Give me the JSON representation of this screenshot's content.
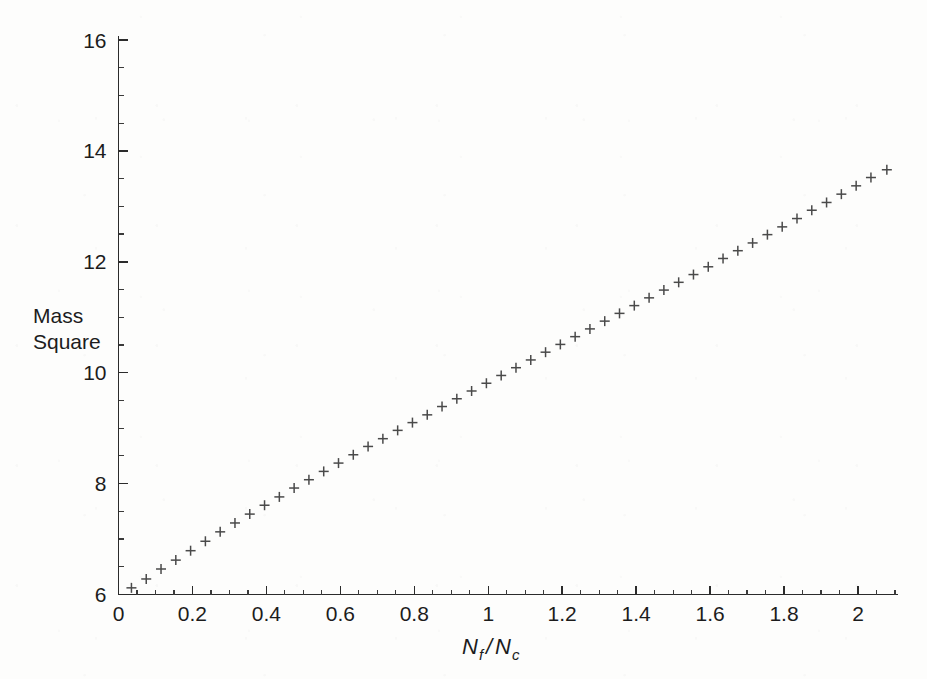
{
  "chart_data": {
    "type": "scatter",
    "title": "",
    "xlabel": "Nf/Nc",
    "xlabel_parts": {
      "n1": "N",
      "sub1": "f",
      "slash": "/",
      "n2": "N",
      "sub2": "c"
    },
    "ylabel": "Mass Square",
    "ylabel_line1": "Mass",
    "ylabel_line2": "Square",
    "marker": "plus",
    "marker_color": "#4a4a4a",
    "grid": false,
    "legend": null,
    "xlim": [
      0,
      2.12
    ],
    "ylim": [
      6,
      16
    ],
    "x_ticks": [
      0,
      0.2,
      0.4,
      0.6,
      0.8,
      1,
      1.2,
      1.4,
      1.6,
      1.8,
      2
    ],
    "x_tick_labels": [
      "0",
      "0.2",
      "0.4",
      "0.6",
      "0.8",
      "1",
      "1.2",
      "1.4",
      "1.6",
      "1.8",
      "2"
    ],
    "x_minor_step": 0.05,
    "y_ticks": [
      6,
      8,
      10,
      12,
      14,
      16
    ],
    "y_tick_labels": [
      "6",
      "8",
      "10",
      "12",
      "14",
      "16"
    ],
    "y_minor_step": 0.5,
    "x": [
      0.035,
      0.075,
      0.115,
      0.155,
      0.195,
      0.235,
      0.275,
      0.315,
      0.355,
      0.395,
      0.435,
      0.475,
      0.515,
      0.555,
      0.595,
      0.635,
      0.675,
      0.715,
      0.755,
      0.795,
      0.835,
      0.875,
      0.915,
      0.955,
      0.995,
      1.035,
      1.075,
      1.115,
      1.155,
      1.195,
      1.235,
      1.275,
      1.315,
      1.355,
      1.395,
      1.435,
      1.475,
      1.515,
      1.555,
      1.595,
      1.635,
      1.675,
      1.715,
      1.755,
      1.795,
      1.835,
      1.875,
      1.915,
      1.955,
      1.995,
      2.035,
      2.078
    ],
    "y": [
      6.12,
      6.28,
      6.46,
      6.62,
      6.79,
      6.96,
      7.13,
      7.29,
      7.45,
      7.61,
      7.76,
      7.92,
      8.07,
      8.22,
      8.37,
      8.52,
      8.67,
      8.81,
      8.96,
      9.1,
      9.24,
      9.39,
      9.53,
      9.67,
      9.81,
      9.95,
      10.09,
      10.23,
      10.37,
      10.51,
      10.65,
      10.79,
      10.93,
      11.07,
      11.21,
      11.35,
      11.49,
      11.63,
      11.77,
      11.91,
      12.06,
      12.2,
      12.34,
      12.49,
      12.63,
      12.78,
      12.93,
      13.07,
      13.22,
      13.37,
      13.52,
      13.66
    ]
  },
  "figure": {
    "background_color": "#fdfdfc",
    "ink_color": "#2b2b2b"
  }
}
